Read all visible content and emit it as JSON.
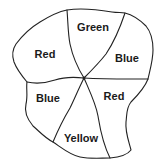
{
  "diagram": {
    "type": "map-coloring",
    "regions": [
      {
        "id": "top",
        "label": "Green",
        "color": "Green"
      },
      {
        "id": "upper-left",
        "label": "Red",
        "color": "Red"
      },
      {
        "id": "upper-right",
        "label": "Blue",
        "color": "Blue"
      },
      {
        "id": "lower-left",
        "label": "Blue",
        "color": "Blue"
      },
      {
        "id": "lower-right",
        "label": "Red",
        "color": "Red"
      },
      {
        "id": "bottom",
        "label": "Yellow",
        "color": "Yellow"
      }
    ],
    "center_point": "all six regions meet at a single central vertex"
  }
}
